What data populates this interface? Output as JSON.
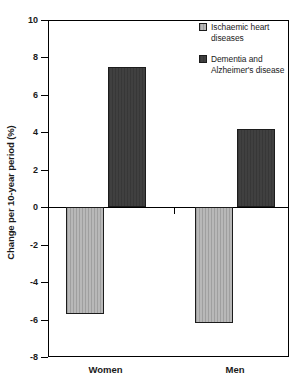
{
  "chart_data": {
    "type": "bar",
    "title": "",
    "subtitle": "",
    "xlabel": "",
    "ylabel": "Change per 10-year period (%)",
    "categories": [
      "Women",
      "Men"
    ],
    "series": [
      {
        "name": "Ischaemic heart diseases",
        "color": "#b8b8b8",
        "values": [
          -5.7,
          -6.2
        ]
      },
      {
        "name": "Dementia and Alzheimer's disease",
        "color": "#404040",
        "values": [
          7.5,
          4.2
        ]
      }
    ],
    "ylim": [
      -8,
      10
    ],
    "ytick_step": 2,
    "yticks": [
      10,
      8,
      6,
      4,
      2,
      0,
      -2,
      -4,
      -6,
      -8
    ],
    "ytick_labels": [
      "10",
      "8",
      "6",
      "4",
      "2",
      "0",
      "-2",
      "-4",
      "-6",
      "-8"
    ],
    "grid": false,
    "legend_position": "top-right",
    "zero_line": true,
    "annotations": []
  },
  "axes": {
    "y_title": "Change per 10-year period (%)"
  },
  "legend": {
    "entries": [
      {
        "label": "Ischaemic heart diseases",
        "color": "#b8b8b8"
      },
      {
        "label": "Dementia and Alzheimer's disease",
        "color": "#404040"
      }
    ]
  },
  "colors": {
    "series_light": "#b8b8b8",
    "series_dark": "#404040",
    "axis": "#000000",
    "text": "#1a1a1a",
    "background": "#ffffff"
  }
}
